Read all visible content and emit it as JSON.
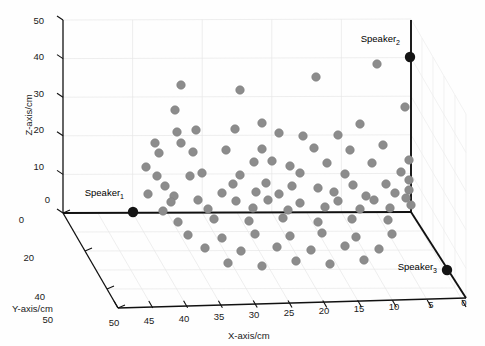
{
  "figure": {
    "background_color": "#fefefe",
    "axis_color": "#000000",
    "grid_color": "#e2e2e2",
    "point_color": "#8c8c8c",
    "marker_color": "#141414"
  },
  "chart_data": {
    "type": "scatter",
    "projection": "3d",
    "title": "",
    "xlabel": "X-axis/cm",
    "ylabel": "Y-axis/cm",
    "zlabel": "Z-axis/cm",
    "xlim": [
      50,
      0
    ],
    "ylim": [
      0,
      50
    ],
    "zlim": [
      0,
      50
    ],
    "xticks": [
      50,
      45,
      40,
      35,
      30,
      25,
      20,
      15,
      10,
      5,
      0
    ],
    "yticks": [
      0,
      20,
      40,
      50
    ],
    "zticks": [
      0,
      10,
      20,
      30,
      40,
      50
    ],
    "grid": true,
    "legend": "none",
    "annotations": [
      {
        "label": "Speaker",
        "subscript": "1",
        "px": 133,
        "py": 212,
        "lx": 124,
        "ly": 196
      },
      {
        "label": "Speaker",
        "subscript": "2",
        "px": 410,
        "py": 57,
        "lx": 400,
        "ly": 42
      },
      {
        "label": "Speaker",
        "subscript": "3",
        "px": 447,
        "py": 270,
        "lx": 437,
        "ly": 270
      }
    ],
    "series": [
      {
        "name": "microphone-nodes",
        "marker": "filled-circle",
        "color": "#8c8c8c",
        "count": 78,
        "points_px": [
          [
            181,
            85
          ],
          [
            240,
            90
          ],
          [
            316,
            77
          ],
          [
            377,
            64
          ],
          [
            175,
            110
          ],
          [
            262,
            123
          ],
          [
            405,
            107
          ],
          [
            177,
            132
          ],
          [
            196,
            130
          ],
          [
            235,
            129
          ],
          [
            279,
            133
          ],
          [
            360,
            124
          ],
          [
            155,
            143
          ],
          [
            181,
            143
          ],
          [
            303,
            136
          ],
          [
            338,
            135
          ],
          [
            159,
            153
          ],
          [
            193,
            152
          ],
          [
            226,
            150
          ],
          [
            262,
            149
          ],
          [
            314,
            148
          ],
          [
            350,
            150
          ],
          [
            383,
            145
          ],
          [
            146,
            167
          ],
          [
            254,
            162
          ],
          [
            272,
            161
          ],
          [
            290,
            166
          ],
          [
            327,
            163
          ],
          [
            372,
            163
          ],
          [
            409,
            160
          ],
          [
            157,
            176
          ],
          [
            190,
            176
          ],
          [
            202,
            173
          ],
          [
            240,
            175
          ],
          [
            300,
            173
          ],
          [
            345,
            174
          ],
          [
            401,
            172
          ],
          [
            165,
            186
          ],
          [
            233,
            184
          ],
          [
            266,
            183
          ],
          [
            292,
            186
          ],
          [
            318,
            188
          ],
          [
            353,
            185
          ],
          [
            386,
            184
          ],
          [
            409,
            180
          ],
          [
            148,
            194
          ],
          [
            174,
            196
          ],
          [
            222,
            193
          ],
          [
            256,
            192
          ],
          [
            279,
            194
          ],
          [
            334,
            192
          ],
          [
            366,
            196
          ],
          [
            395,
            193
          ],
          [
            409,
            190
          ],
          [
            171,
            202
          ],
          [
            198,
            200
          ],
          [
            236,
            201
          ],
          [
            268,
            200
          ],
          [
            300,
            203
          ],
          [
            338,
            201
          ],
          [
            374,
            200
          ],
          [
            406,
            198
          ],
          [
            163,
            211
          ],
          [
            208,
            209
          ],
          [
            253,
            208
          ],
          [
            288,
            210
          ],
          [
            325,
            207
          ],
          [
            360,
            209
          ],
          [
            390,
            208
          ],
          [
            411,
            205
          ],
          [
            178,
            222
          ],
          [
            214,
            219
          ],
          [
            249,
            221
          ],
          [
            283,
            218
          ],
          [
            318,
            222
          ],
          [
            352,
            219
          ],
          [
            388,
            220
          ],
          [
            188,
            235
          ],
          [
            222,
            238
          ],
          [
            255,
            234
          ],
          [
            290,
            236
          ],
          [
            322,
            233
          ],
          [
            356,
            237
          ],
          [
            392,
            234
          ],
          [
            205,
            248
          ],
          [
            241,
            251
          ],
          [
            277,
            247
          ],
          [
            311,
            250
          ],
          [
            345,
            246
          ],
          [
            379,
            249
          ],
          [
            228,
            263
          ],
          [
            262,
            266
          ],
          [
            296,
            261
          ],
          [
            330,
            264
          ],
          [
            364,
            260
          ]
        ]
      }
    ]
  },
  "axes": {
    "z_axis_ticks": [
      {
        "value": "50",
        "x": 44,
        "y": 24
      },
      {
        "value": "40",
        "x": 44,
        "y": 60
      },
      {
        "value": "30",
        "x": 44,
        "y": 97
      },
      {
        "value": "20",
        "x": 44,
        "y": 133
      },
      {
        "value": "10",
        "x": 44,
        "y": 170
      },
      {
        "value": "0",
        "x": 50,
        "y": 203
      }
    ],
    "y_axis_ticks": [
      {
        "value": "0",
        "x": 24,
        "y": 223
      },
      {
        "value": "20",
        "x": 34,
        "y": 261
      },
      {
        "value": "40",
        "x": 45,
        "y": 300
      },
      {
        "value": "50",
        "x": 53,
        "y": 323
      }
    ],
    "x_axis_ticks": [
      {
        "value": "50",
        "x": 114,
        "y": 326
      },
      {
        "value": "45",
        "x": 149,
        "y": 324
      },
      {
        "value": "40",
        "x": 184,
        "y": 322
      },
      {
        "value": "35",
        "x": 219,
        "y": 320
      },
      {
        "value": "30",
        "x": 254,
        "y": 318
      },
      {
        "value": "25",
        "x": 289,
        "y": 316
      },
      {
        "value": "20",
        "x": 324,
        "y": 314
      },
      {
        "value": "15",
        "x": 359,
        "y": 312
      },
      {
        "value": "10",
        "x": 394,
        "y": 310
      },
      {
        "value": "5",
        "x": 431,
        "y": 308
      },
      {
        "value": "0",
        "x": 464,
        "y": 306
      }
    ],
    "titles": {
      "x": "X-axis/cm",
      "y": "Y-axis/cm",
      "z": "Z-axis/cm"
    }
  }
}
